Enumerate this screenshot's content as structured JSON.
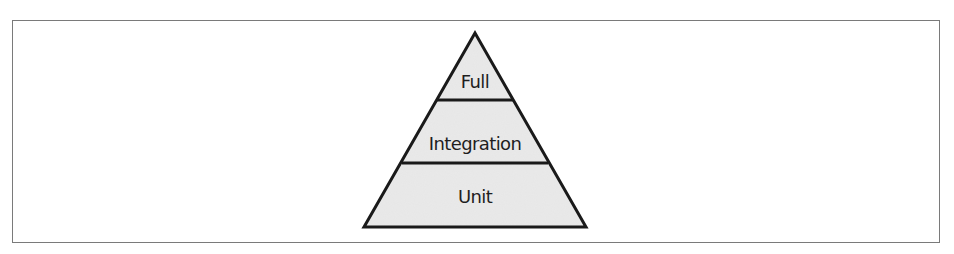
{
  "diagram": {
    "type": "pyramid",
    "colors": {
      "fill": "#e6e6e6",
      "stroke": "#1a1a1a",
      "frame": "#7a7a7a",
      "text": "#1e1e1e"
    },
    "tiers": [
      {
        "label": "Full",
        "position": "top"
      },
      {
        "label": "Integration",
        "position": "middle"
      },
      {
        "label": "Unit",
        "position": "bottom"
      }
    ]
  }
}
